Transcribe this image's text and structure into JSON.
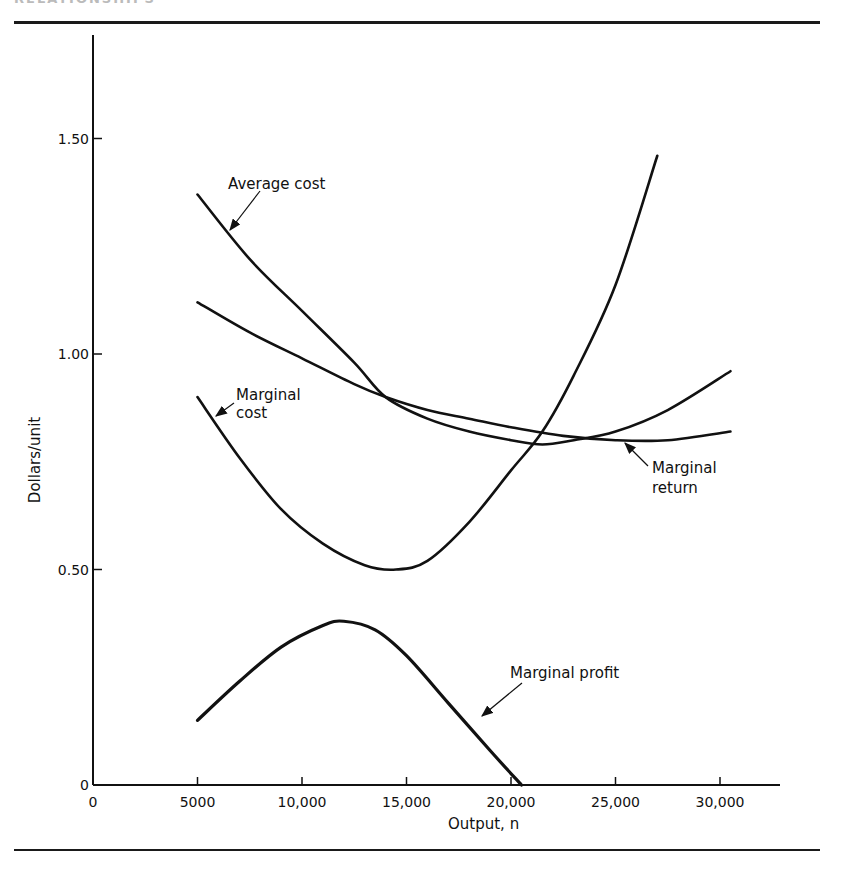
{
  "page": {
    "header_fragment": "RELATIONSHIPS"
  },
  "chart_data": {
    "type": "line",
    "title": "",
    "xlabel": "Output, n",
    "ylabel": "Dollars/unit",
    "xlim": [
      0,
      33000
    ],
    "ylim": [
      0,
      1.7
    ],
    "grid": false,
    "x_ticks": [
      0,
      5000,
      10000,
      15000,
      20000,
      25000,
      30000
    ],
    "x_tick_labels": [
      "0",
      "5000",
      "10,000",
      "15,000",
      "20,000",
      "25,000",
      "30,000"
    ],
    "y_ticks": [
      0,
      0.5,
      1.0,
      1.5
    ],
    "y_tick_labels": [
      "0",
      "0.50",
      "1.00",
      "1.50"
    ],
    "series": [
      {
        "name": "Average cost",
        "x": [
          5000,
          7500,
          10000,
          12500,
          14000,
          16000,
          18000,
          20000,
          21500,
          23000,
          25000,
          27500,
          30500
        ],
        "values": [
          1.37,
          1.22,
          1.1,
          0.98,
          0.9,
          0.85,
          0.82,
          0.8,
          0.79,
          0.8,
          0.82,
          0.87,
          0.96
        ]
      },
      {
        "name": "Marginal return",
        "x": [
          5000,
          7500,
          10000,
          12500,
          14000,
          16000,
          18000,
          20000,
          22500,
          25000,
          27500,
          30500
        ],
        "values": [
          1.12,
          1.05,
          0.99,
          0.93,
          0.9,
          0.87,
          0.85,
          0.83,
          0.81,
          0.8,
          0.8,
          0.82
        ]
      },
      {
        "name": "Marginal cost",
        "x": [
          5000,
          7000,
          9000,
          11000,
          13000,
          14500,
          16000,
          18000,
          20000,
          21500,
          23000,
          25000,
          27000
        ],
        "values": [
          0.9,
          0.76,
          0.64,
          0.56,
          0.51,
          0.5,
          0.52,
          0.61,
          0.73,
          0.82,
          0.95,
          1.16,
          1.46
        ]
      },
      {
        "name": "Marginal profit",
        "x": [
          5000,
          7000,
          9000,
          11000,
          12000,
          13500,
          15000,
          17000,
          19000,
          20500
        ],
        "values": [
          0.15,
          0.24,
          0.32,
          0.37,
          0.38,
          0.36,
          0.3,
          0.19,
          0.08,
          0.0
        ]
      }
    ],
    "annotations": [
      {
        "text": "Average cost",
        "lines": [
          "Average cost"
        ],
        "series": "Average cost"
      },
      {
        "text": "Marginal cost",
        "lines": [
          "Marginal",
          "cost"
        ],
        "series": "Marginal cost"
      },
      {
        "text": "Marginal return",
        "lines": [
          "Marginal",
          "return"
        ],
        "series": "Marginal return"
      },
      {
        "text": "Marginal profit",
        "lines": [
          "Marginal profit"
        ],
        "series": "Marginal profit"
      }
    ]
  }
}
